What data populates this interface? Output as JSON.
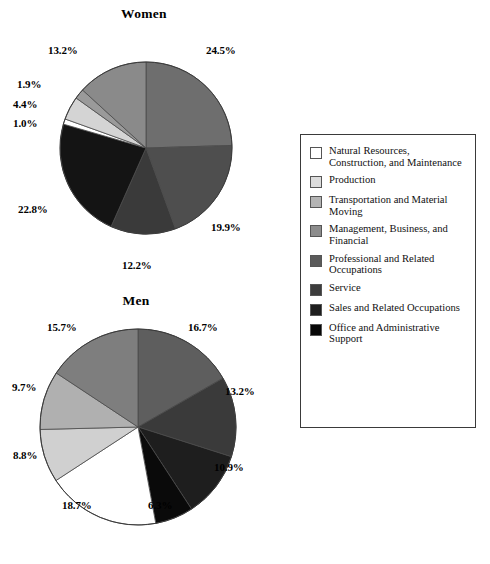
{
  "chart_data": [
    {
      "type": "pie",
      "title": "Women",
      "categories": [
        "Management, Business, and Financial",
        "Professional and Related Occupations",
        "Service",
        "Sales and Related Occupations",
        "Office and Administrative Support",
        "Natural Resources, Construction, and Maintenance",
        "Production",
        "Transportation and Material Moving"
      ],
      "values": [
        24.5,
        19.9,
        12.2,
        22.8,
        1.0,
        4.4,
        1.9,
        13.2
      ],
      "labels": [
        "24.5%",
        "19.9%",
        "12.2%",
        "22.8%",
        "1.0%",
        "4.4%",
        "1.9%",
        "13.2%"
      ],
      "colors": [
        "#6e6e6e",
        "#4e4e4e",
        "#3a3a3a",
        "#141414",
        "#ffffff",
        "#d4d4d4",
        "#9a9a9a",
        "#8a8a8a"
      ],
      "start_angle": 0,
      "direction": "clockwise",
      "legend": true,
      "xlabel": "",
      "ylabel": ""
    },
    {
      "type": "pie",
      "title": "Men",
      "categories": [
        "Management, Business, and Financial",
        "Professional and Related Occupations",
        "Service",
        "Sales and Related Occupations",
        "Office and Administrative Support",
        "Natural Resources, Construction, and Maintenance",
        "Production",
        "Transportation and Material Moving"
      ],
      "values": [
        16.7,
        13.2,
        10.9,
        6.3,
        18.7,
        8.8,
        9.7,
        15.7
      ],
      "labels": [
        "16.7%",
        "13.2%",
        "10.9%",
        "6.3%",
        "18.7%",
        "8.8%",
        "9.7%",
        "15.7%"
      ],
      "colors": [
        "#5e5e5e",
        "#3a3a3a",
        "#1e1e1e",
        "#0a0a0a",
        "#ffffff",
        "#d0d0d0",
        "#b0b0b0",
        "#7e7e7e"
      ],
      "start_angle": 0,
      "direction": "clockwise",
      "legend": true,
      "xlabel": "",
      "ylabel": ""
    }
  ],
  "legend": {
    "items": [
      {
        "label": "Natural Resources, Construction, and Maintenance",
        "color": "#ffffff"
      },
      {
        "label": "Production",
        "color": "#dcdcdc"
      },
      {
        "label": "Transportation and Material Moving",
        "color": "#b4b4b4"
      },
      {
        "label": "Management, Business, and Financial",
        "color": "#8c8c8c"
      },
      {
        "label": "Professional and Related Occupations",
        "color": "#5a5a5a"
      },
      {
        "label": "Service",
        "color": "#3c3c3c"
      },
      {
        "label": "Sales and Related Occupations",
        "color": "#1e1e1e"
      },
      {
        "label": "Office and Administrative Support",
        "color": "#070707"
      }
    ]
  },
  "women": {
    "title": "Women",
    "pct": {
      "p1": "24.5%",
      "p2": "19.9%",
      "p3": "12.2%",
      "p4": "22.8%",
      "p5": "1.0%",
      "p6": "4.4%",
      "p7": "1.9%",
      "p8": "13.2%"
    }
  },
  "men": {
    "title": "Men",
    "pct": {
      "p1": "16.7%",
      "p2": "13.2%",
      "p3": "10.9%",
      "p4": "6.3%",
      "p5": "18.7%",
      "p6": "8.8%",
      "p7": "9.7%",
      "p8": "15.7%"
    }
  }
}
